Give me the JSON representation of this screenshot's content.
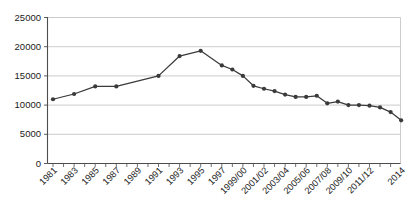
{
  "chart_data": {
    "type": "line",
    "title": "",
    "subtitle": "",
    "xlabel": "",
    "ylabel": "",
    "ylim": [
      0,
      25000
    ],
    "y_ticks": [
      0,
      5000,
      10000,
      15000,
      20000,
      25000
    ],
    "y_tick_labels": [
      "0",
      "5000",
      "10000",
      "15000",
      "20000",
      "25000"
    ],
    "grid": true,
    "legend": false,
    "legend_position": "none",
    "marker": "circle",
    "line_color": "#3a3a3a",
    "marker_color": "#3a3a3a",
    "grid_color": "#bfbfbf",
    "axis_color": "#4d4d4d",
    "x_tick_labels": [
      "1981",
      "1983",
      "1985",
      "1987",
      "1989",
      "1991",
      "1993",
      "1995",
      "1997",
      "1999/00",
      "2001/02",
      "2003/04",
      "2005/06",
      "2007/08",
      "2009/10",
      "2011/12",
      "2014"
    ],
    "x_tick_indices": [
      0,
      2,
      4,
      6,
      8,
      10,
      12,
      14,
      16,
      18,
      20,
      22,
      24,
      26,
      28,
      30,
      33
    ],
    "categories": [
      "1981",
      "1982",
      "1983",
      "1984",
      "1985",
      "1986",
      "1987",
      "1988",
      "1989",
      "1990",
      "1991",
      "1992",
      "1993",
      "1994",
      "1995",
      "1996",
      "1997",
      "1998",
      "1999/00",
      "2000/01",
      "2001/02",
      "2002/03",
      "2003/04",
      "2004/05",
      "2005/06",
      "2006/07",
      "2007/08",
      "2008/09",
      "2009/10",
      "2010/11",
      "2011/12",
      "2012/13",
      "2013/14",
      "2014"
    ],
    "values": [
      11000,
      null,
      11900,
      null,
      13200,
      null,
      13200,
      null,
      null,
      null,
      15000,
      null,
      18400,
      null,
      19300,
      null,
      16800,
      null,
      15000,
      13300,
      12800,
      12400,
      11800,
      11400,
      11400,
      11600,
      10300,
      10600,
      10000,
      10000,
      9900,
      9600,
      8800,
      7400
    ],
    "points": [
      {
        "label": "1981",
        "x_index": 0,
        "y": 11000
      },
      {
        "label": "1983",
        "x_index": 2,
        "y": 11900
      },
      {
        "label": "1985",
        "x_index": 4,
        "y": 13200
      },
      {
        "label": "1987",
        "x_index": 6,
        "y": 13200
      },
      {
        "label": "1991",
        "x_index": 10,
        "y": 15000
      },
      {
        "label": "1993",
        "x_index": 12,
        "y": 18400
      },
      {
        "label": "1995",
        "x_index": 14,
        "y": 19300
      },
      {
        "label": "1997",
        "x_index": 16,
        "y": 16800
      },
      {
        "label": "1998",
        "x_index": 17,
        "y": 16100
      },
      {
        "label": "1999/00",
        "x_index": 18,
        "y": 15000
      },
      {
        "label": "2000/01",
        "x_index": 19,
        "y": 13300
      },
      {
        "label": "2001/02",
        "x_index": 20,
        "y": 12800
      },
      {
        "label": "2002/03",
        "x_index": 21,
        "y": 12400
      },
      {
        "label": "2003/04",
        "x_index": 22,
        "y": 11800
      },
      {
        "label": "2004/05",
        "x_index": 23,
        "y": 11400
      },
      {
        "label": "2005/06",
        "x_index": 24,
        "y": 11400
      },
      {
        "label": "2006/07",
        "x_index": 25,
        "y": 11600
      },
      {
        "label": "2007/08",
        "x_index": 26,
        "y": 10300
      },
      {
        "label": "2008/09",
        "x_index": 27,
        "y": 10600
      },
      {
        "label": "2009/10",
        "x_index": 28,
        "y": 10000
      },
      {
        "label": "2010/11",
        "x_index": 29,
        "y": 10000
      },
      {
        "label": "2011/12",
        "x_index": 30,
        "y": 9900
      },
      {
        "label": "2012/13",
        "x_index": 31,
        "y": 9600
      },
      {
        "label": "2013/14",
        "x_index": 32,
        "y": 8800
      },
      {
        "label": "2014",
        "x_index": 33,
        "y": 7400
      }
    ]
  }
}
